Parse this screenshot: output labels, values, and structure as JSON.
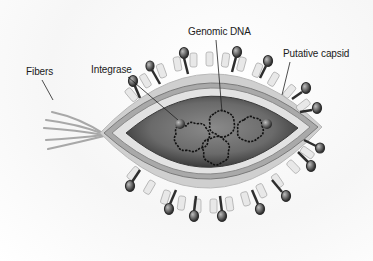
{
  "diagram": {
    "labels": {
      "fibers": "Fibers",
      "integrase": "Integrase",
      "genomic_dna": "Genomic DNA",
      "putative_capsid": "Putative capsid"
    },
    "colors": {
      "background": "#ffffff",
      "core_dark": "#4a4a4a",
      "core_mid": "#7a7a7a",
      "capsid_band": "#e2e2e2",
      "envelope": "#9a9a9a",
      "spike_dark": "#3a3a3a",
      "fiber": "#a8a8a8",
      "label_text": "#1a1a1a"
    }
  }
}
